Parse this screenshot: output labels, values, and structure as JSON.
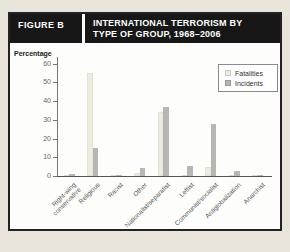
{
  "page": {
    "background": "#e9e5da",
    "panel_background": "#fdfdfb",
    "header_background": "#171717",
    "header_text_color": "#ffffff"
  },
  "figure_label": "FIGURE B",
  "title_line1": "INTERNATIONAL TERRORISM BY",
  "title_line2": "TYPE OF GROUP, 1968–2006",
  "chart_data": {
    "type": "bar",
    "title": "International Terrorism by Type of Group, 1968–2006",
    "ylabel": "Percentage",
    "xlabel": "",
    "ylim": [
      0,
      63
    ],
    "yticks": [
      0,
      10,
      20,
      30,
      40,
      50,
      60
    ],
    "grid": false,
    "legend_position": "top-right",
    "categories": [
      "Right-wing\nconservative",
      "Religious",
      "Racist",
      "Other",
      "Nationalist/separatist",
      "Leftist",
      "Communist/socialist",
      "Antiglobalization",
      "Anarchist"
    ],
    "series": [
      {
        "name": "Fatalities",
        "color": "#edecdf",
        "values": [
          0.3,
          55,
          0.2,
          1.5,
          34,
          0.5,
          5,
          0.3,
          0.2
        ]
      },
      {
        "name": "Incidents",
        "color": "#b7b6b2",
        "values": [
          1,
          15,
          0.4,
          4.5,
          37,
          5.5,
          28,
          2.5,
          0.8
        ]
      }
    ]
  }
}
